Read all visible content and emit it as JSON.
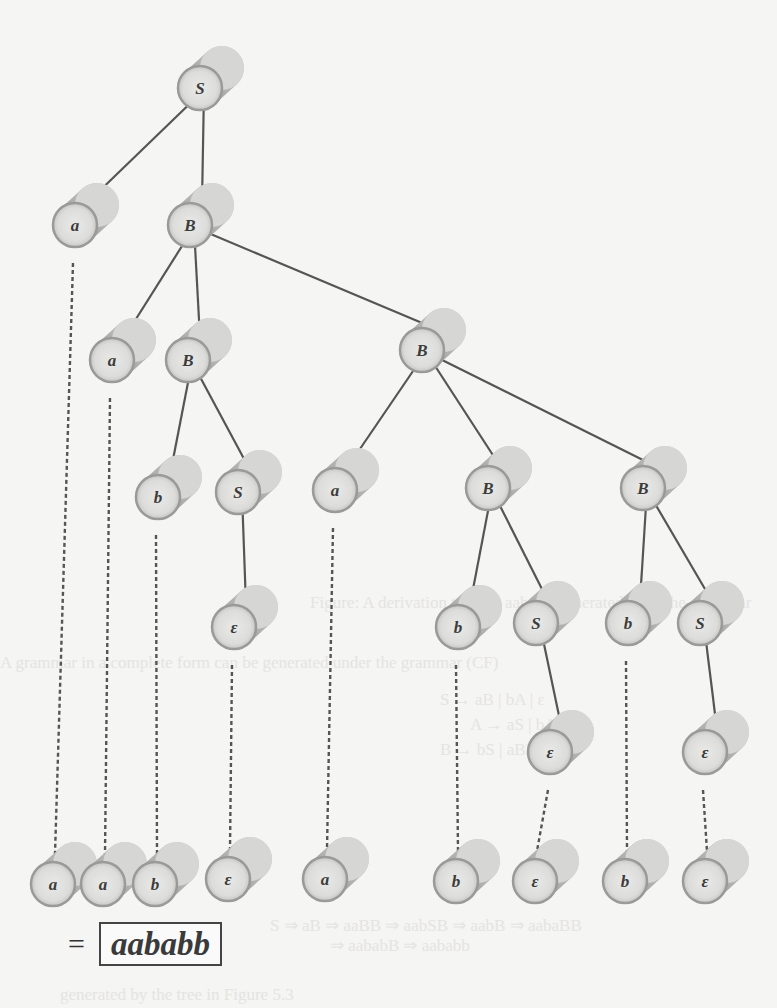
{
  "diagram": {
    "title": "Derivation tree for aababb",
    "nodes": [
      {
        "id": "n0",
        "label": "S",
        "x": 200,
        "y": 88
      },
      {
        "id": "n1",
        "label": "a",
        "x": 75,
        "y": 225
      },
      {
        "id": "n2",
        "label": "B",
        "x": 190,
        "y": 225
      },
      {
        "id": "n3",
        "label": "a",
        "x": 112,
        "y": 360
      },
      {
        "id": "n4",
        "label": "B",
        "x": 188,
        "y": 360
      },
      {
        "id": "n5",
        "label": "B",
        "x": 422,
        "y": 350
      },
      {
        "id": "n6",
        "label": "b",
        "x": 158,
        "y": 497
      },
      {
        "id": "n7",
        "label": "S",
        "x": 238,
        "y": 492
      },
      {
        "id": "n8",
        "label": "a",
        "x": 335,
        "y": 490
      },
      {
        "id": "n9",
        "label": "B",
        "x": 488,
        "y": 488
      },
      {
        "id": "n10",
        "label": "B",
        "x": 643,
        "y": 488
      },
      {
        "id": "n11",
        "label": "ε",
        "x": 234,
        "y": 627
      },
      {
        "id": "n12",
        "label": "b",
        "x": 458,
        "y": 627
      },
      {
        "id": "n13",
        "label": "S",
        "x": 536,
        "y": 623
      },
      {
        "id": "n14",
        "label": "b",
        "x": 628,
        "y": 623
      },
      {
        "id": "n15",
        "label": "S",
        "x": 700,
        "y": 623
      },
      {
        "id": "n16",
        "label": "ε",
        "x": 550,
        "y": 752
      },
      {
        "id": "n17",
        "label": "ε",
        "x": 705,
        "y": 752
      }
    ],
    "edges": [
      [
        "n0",
        "n1"
      ],
      [
        "n0",
        "n2"
      ],
      [
        "n2",
        "n3"
      ],
      [
        "n2",
        "n4"
      ],
      [
        "n2",
        "n5"
      ],
      [
        "n4",
        "n6"
      ],
      [
        "n4",
        "n7"
      ],
      [
        "n5",
        "n8"
      ],
      [
        "n5",
        "n9"
      ],
      [
        "n5",
        "n10"
      ],
      [
        "n7",
        "n11"
      ],
      [
        "n9",
        "n12"
      ],
      [
        "n9",
        "n13"
      ],
      [
        "n10",
        "n14"
      ],
      [
        "n10",
        "n15"
      ],
      [
        "n13",
        "n16"
      ],
      [
        "n15",
        "n17"
      ]
    ],
    "leaves": [
      {
        "label": "a",
        "x": 53,
        "y": 884,
        "from": "n1"
      },
      {
        "label": "a",
        "x": 103,
        "y": 884,
        "from": "n3"
      },
      {
        "label": "b",
        "x": 155,
        "y": 884,
        "from": "n6"
      },
      {
        "label": "ε",
        "x": 228,
        "y": 879,
        "from": "n11"
      },
      {
        "label": "a",
        "x": 325,
        "y": 879,
        "from": "n8"
      },
      {
        "label": "b",
        "x": 456,
        "y": 881,
        "from": "n12"
      },
      {
        "label": "ε",
        "x": 535,
        "y": 881,
        "from": "n16"
      },
      {
        "label": "b",
        "x": 625,
        "y": 881,
        "from": "n14"
      },
      {
        "label": "ε",
        "x": 705,
        "y": 881,
        "from": "n17"
      }
    ]
  },
  "result": {
    "equals": "=",
    "word": "aababb"
  },
  "bleed_through": [
    {
      "text": "Figure: A derivation tree for aababb generated from the grammar",
      "x": 310,
      "y": 593
    },
    {
      "text": "A grammar in a complete form can be generated under the grammar (CF)",
      "x": 0,
      "y": 653
    },
    {
      "text": "S → aB | bA | ε",
      "x": 440,
      "y": 690
    },
    {
      "text": "A → aS | bAA",
      "x": 470,
      "y": 715
    },
    {
      "text": "B → bS | aBB",
      "x": 440,
      "y": 740
    },
    {
      "text": "S ⇒ aB ⇒ aaBB ⇒ aabSB ⇒ aabB ⇒ aabaBB",
      "x": 270,
      "y": 915
    },
    {
      "text": "⇒ aababB ⇒ aababb",
      "x": 330,
      "y": 935
    },
    {
      "text": "generated by the tree in Figure 5.3",
      "x": 60,
      "y": 985
    }
  ]
}
